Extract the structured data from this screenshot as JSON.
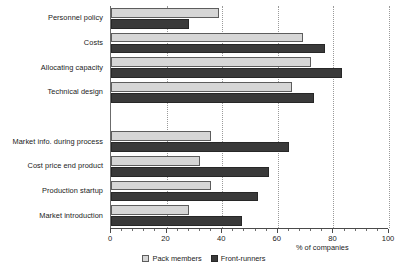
{
  "chart_data": {
    "type": "bar",
    "orientation": "horizontal",
    "title": "",
    "xlabel": "% of companies",
    "ylabel": "",
    "xlim": [
      0,
      100
    ],
    "xticks": [
      0,
      20,
      40,
      60,
      80,
      100
    ],
    "xtick_labels": [
      "0",
      "20",
      "40",
      "60",
      "80",
      "100"
    ],
    "grid": true,
    "grid_axis": "x",
    "legend_position": "bottom-center",
    "categories": [
      "Personnel policy",
      "Costs",
      "Allocating capacity",
      "Technical design",
      "Market info. during process",
      "Cost price end product",
      "Production startup",
      "Market introduction"
    ],
    "group_break_after_index": 3,
    "series": [
      {
        "name": "Pack members",
        "color": "#d6d6d6",
        "values": [
          39,
          69,
          72,
          65,
          36,
          32,
          36,
          28
        ]
      },
      {
        "name": "Front-runners",
        "color": "#3a3a3a",
        "values": [
          28,
          77,
          83,
          73,
          64,
          57,
          53,
          47
        ]
      }
    ]
  },
  "legend": {
    "items": [
      {
        "label": "Pack members",
        "swatch": "light"
      },
      {
        "label": "Front-runners",
        "swatch": "dark"
      }
    ]
  }
}
